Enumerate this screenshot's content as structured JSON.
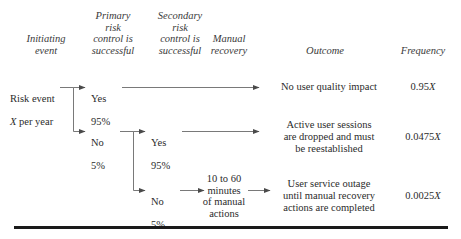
{
  "figure": {
    "type": "event-tree-diagram",
    "accent_color": "#2b2b2b",
    "rule_color": "#1a1a1a"
  },
  "columns": {
    "initiating_event": "Initiating\nevent",
    "primary_risk_control": "Primary\nrisk\ncontrol is\nsuccessful",
    "secondary_risk_control": "Secondary\nrisk\ncontrol is\nsuccessful",
    "manual_recovery": "Manual\nrecovery",
    "outcome": "Outcome",
    "frequency": "Frequency"
  },
  "initiating_event": {
    "line1": "Risk event",
    "line2_italic": "X",
    "line2_rest": " per year"
  },
  "branches": [
    {
      "id": "primary-yes",
      "answer": "Yes",
      "probability": "95%"
    },
    {
      "id": "primary-no",
      "answer": "No",
      "probability": "5%"
    },
    {
      "id": "secondary-yes",
      "answer": "Yes",
      "probability": "95%"
    },
    {
      "id": "secondary-no",
      "answer": "No",
      "probability": "5%"
    }
  ],
  "manual_recovery_node": "10 to 60\nminutes\nof manual\nactions",
  "outcomes": [
    {
      "id": "no-impact",
      "text": "No user quality impact",
      "frequency_value": "0.95",
      "frequency_unit": "X"
    },
    {
      "id": "sessions-dropped",
      "text": "Active user sessions\nare dropped and must\nbe reestablished",
      "frequency_value": "0.0475",
      "frequency_unit": "X"
    },
    {
      "id": "service-outage",
      "text": "User service outage\nuntil manual recovery\nactions are completed",
      "frequency_value": "0.0025",
      "frequency_unit": "X"
    }
  ]
}
